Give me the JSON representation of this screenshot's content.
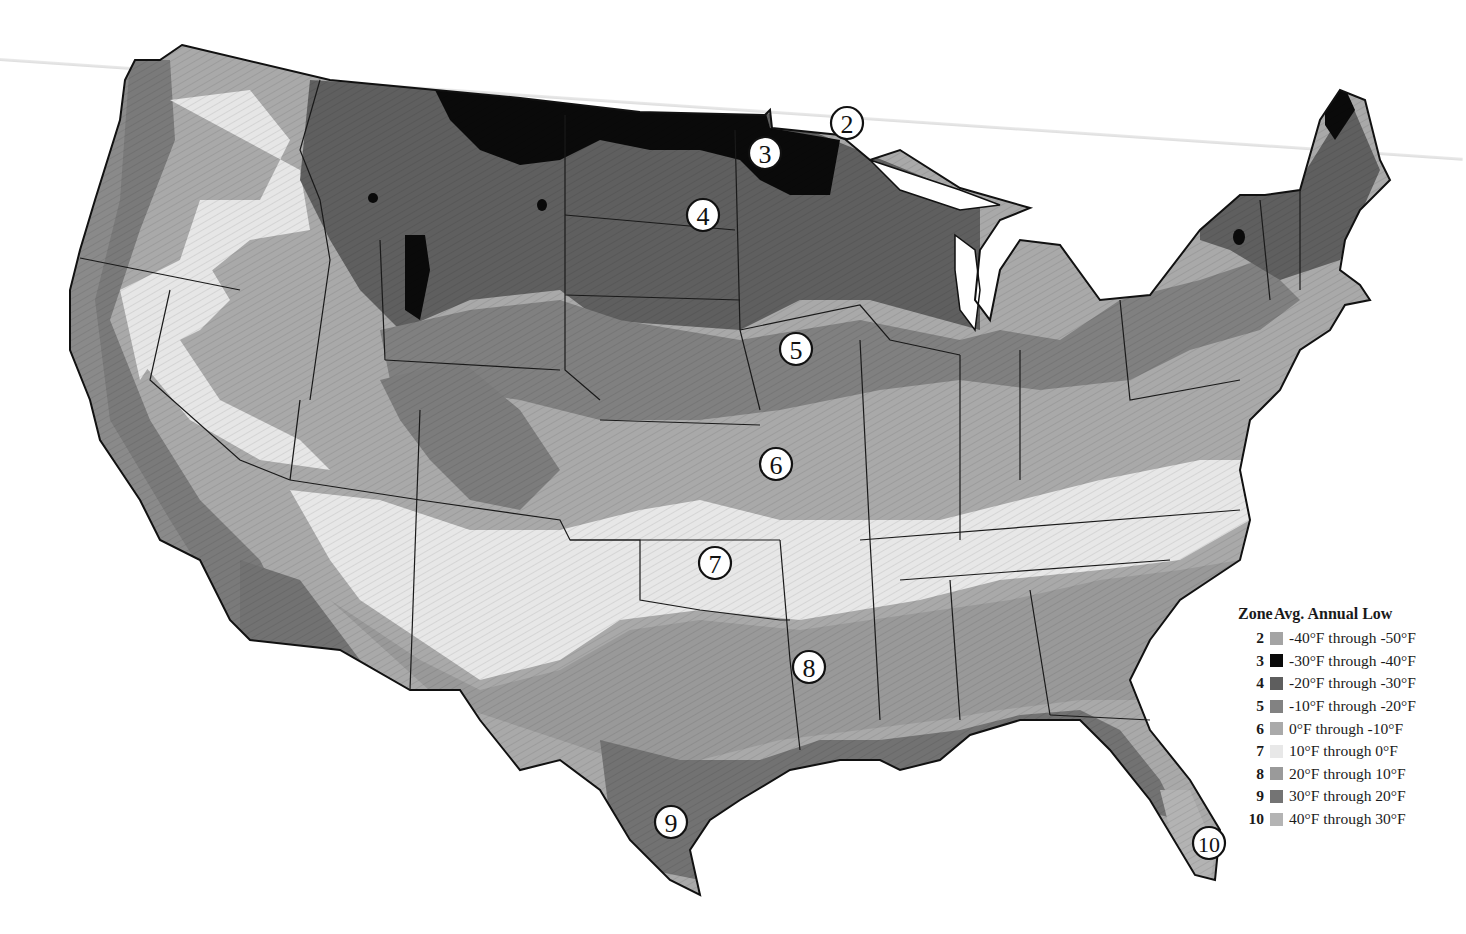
{
  "map": {
    "title": "USDA Plant Hardiness Zones (contiguous United States)",
    "zone_markers": [
      {
        "zone": "2",
        "x": 847,
        "y": 123
      },
      {
        "zone": "3",
        "x": 765,
        "y": 153
      },
      {
        "zone": "4",
        "x": 703,
        "y": 215
      },
      {
        "zone": "5",
        "x": 796,
        "y": 349
      },
      {
        "zone": "6",
        "x": 776,
        "y": 464
      },
      {
        "zone": "7",
        "x": 715,
        "y": 563
      },
      {
        "zone": "8",
        "x": 809,
        "y": 667
      },
      {
        "zone": "9",
        "x": 671,
        "y": 822
      },
      {
        "zone": "10",
        "x": 1209,
        "y": 843
      }
    ]
  },
  "legend": {
    "zone_header": "Zone",
    "low_header": "Avg. Annual Low",
    "items": [
      {
        "zone": "2",
        "range": "-40°F through -50°F",
        "color": "#a4a4a4"
      },
      {
        "zone": "3",
        "range": "-30°F through -40°F",
        "color": "#0a0a0a"
      },
      {
        "zone": "4",
        "range": "-20°F through -30°F",
        "color": "#5e5e5e"
      },
      {
        "zone": "5",
        "range": "-10°F through -20°F",
        "color": "#828282"
      },
      {
        "zone": "6",
        "range": "0°F through -10°F",
        "color": "#aaaaaa"
      },
      {
        "zone": "7",
        "range": "10°F through 0°F",
        "color": "#e8e8e8"
      },
      {
        "zone": "8",
        "range": "20°F through 10°F",
        "color": "#9a9a9a"
      },
      {
        "zone": "9",
        "range": "30°F through 20°F",
        "color": "#747474"
      },
      {
        "zone": "10",
        "range": "40°F through 30°F",
        "color": "#b4b4b4"
      }
    ]
  }
}
